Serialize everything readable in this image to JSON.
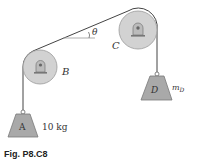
{
  "figure": {
    "caption": "Fig. P8.C8",
    "pulleys": [
      {
        "id": "B",
        "label": "B"
      },
      {
        "id": "C",
        "label": "C"
      }
    ],
    "blocks": [
      {
        "id": "A",
        "label": "A",
        "mass_label": "10 kg"
      },
      {
        "id": "D",
        "label": "D",
        "mass_label": "m_D",
        "mass_symbol": "m",
        "mass_subscript": "D"
      }
    ],
    "angle_label": "θ",
    "colors": {
      "pulley_fill": "#d2d2d2",
      "pulley_stroke": "#9a9a9a",
      "block_fill": "#a9a9a9",
      "block_stroke": "#7a7a7a",
      "rope": "#444444"
    }
  }
}
